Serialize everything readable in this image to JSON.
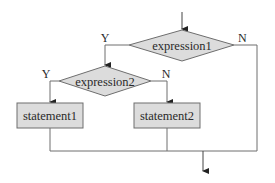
{
  "diagram": {
    "type": "flowchart",
    "colors": {
      "shape_fill": "#dcdcdc",
      "shape_stroke": "#6e6e6e",
      "line": "#6e6e6e",
      "arrow": "#222222",
      "text": "#2a2a2a"
    },
    "nodes": {
      "decision1": {
        "label": "expression1"
      },
      "decision2": {
        "label": "expression2"
      },
      "process1": {
        "label": "statement1"
      },
      "process2": {
        "label": "statement2"
      }
    },
    "edge_labels": {
      "d1_yes": "Y",
      "d1_no": "N",
      "d2_yes": "Y",
      "d2_no": "N"
    }
  }
}
